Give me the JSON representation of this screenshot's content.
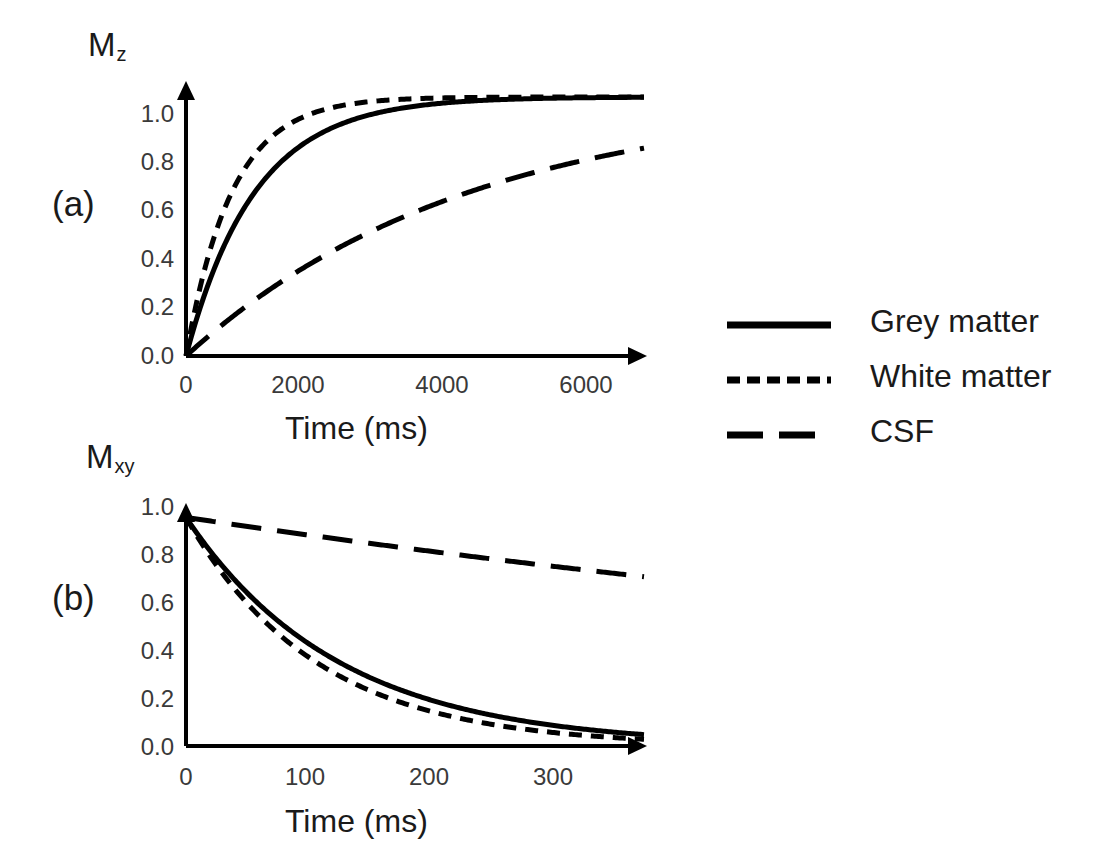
{
  "figure": {
    "background": "#ffffff",
    "ink": "#000000"
  },
  "panels": [
    {
      "label": "(a)",
      "y_axis_name": "M",
      "y_axis_sub": "z",
      "x_title": "Time (ms)",
      "y_ticks": [
        "1.0",
        "0.8",
        "0.6",
        "0.4",
        "0.2",
        "0.0"
      ],
      "x_ticks": [
        "0",
        "2000",
        "4000",
        "6000"
      ]
    },
    {
      "label": "(b)",
      "y_axis_name": "M",
      "y_axis_sub": "xy",
      "x_title": "Time (ms)",
      "y_ticks": [
        "1.0",
        "0.8",
        "0.6",
        "0.4",
        "0.2",
        "0.0"
      ],
      "x_ticks": [
        "0",
        "100",
        "200",
        "300"
      ]
    }
  ],
  "legend": {
    "position": "right-middle",
    "items": [
      {
        "label": "Grey matter",
        "style": "solid",
        "color": "#000000",
        "icon": "solid-line-icon"
      },
      {
        "label": "White matter",
        "style": "dotted",
        "color": "#000000",
        "icon": "short-dashed-line-icon"
      },
      {
        "label": "CSF",
        "style": "long-dash",
        "color": "#000000",
        "icon": "long-dashed-line-icon"
      }
    ]
  },
  "chart_data": [
    {
      "type": "line",
      "panel": "(a)",
      "title": "",
      "xlabel": "Time (ms)",
      "ylabel": "Mz",
      "xlim": [
        0,
        6000
      ],
      "ylim": [
        0.0,
        1.05
      ],
      "xticks": [
        0,
        2000,
        4000,
        6000
      ],
      "yticks": [
        0.0,
        0.2,
        0.4,
        0.6,
        0.8,
        1.0
      ],
      "grid": false,
      "legend_position": "right-middle",
      "model": "Mz = 1 - exp(-t/T1)",
      "x": [
        0,
        250,
        500,
        750,
        1000,
        1500,
        2000,
        2500,
        3000,
        3500,
        4000,
        4500,
        5000,
        5500,
        6000
      ],
      "series": [
        {
          "name": "Grey matter",
          "style": "solid",
          "T1": 900,
          "values": [
            0.0,
            0.24,
            0.43,
            0.57,
            0.67,
            0.81,
            0.89,
            0.94,
            0.96,
            0.98,
            0.99,
            0.99,
            1.0,
            1.0,
            1.0
          ]
        },
        {
          "name": "White matter",
          "style": "dotted",
          "T1": 600,
          "values": [
            0.0,
            0.34,
            0.57,
            0.71,
            0.81,
            0.92,
            0.96,
            0.98,
            0.99,
            1.0,
            1.0,
            1.0,
            1.0,
            1.0,
            1.0
          ]
        },
        {
          "name": "CSF",
          "style": "long-dash",
          "T1": 3700,
          "values": [
            0.0,
            0.065,
            0.13,
            0.18,
            0.24,
            0.33,
            0.42,
            0.49,
            0.56,
            0.61,
            0.66,
            0.7,
            0.74,
            0.77,
            0.8
          ]
        }
      ]
    },
    {
      "type": "line",
      "panel": "(b)",
      "title": "",
      "xlabel": "Time (ms)",
      "ylabel": "Mxy",
      "xlim": [
        0,
        300
      ],
      "ylim": [
        0.0,
        1.05
      ],
      "xticks": [
        0,
        100,
        200,
        300
      ],
      "yticks": [
        0.0,
        0.2,
        0.4,
        0.6,
        0.8,
        1.0
      ],
      "grid": false,
      "legend_position": "right-middle",
      "model": "Mxy = exp(-t/T2)",
      "x": [
        0,
        25,
        50,
        75,
        100,
        125,
        150,
        175,
        200,
        225,
        250,
        275,
        300
      ],
      "series": [
        {
          "name": "Grey matter",
          "style": "solid",
          "T2": 100,
          "values": [
            1.0,
            0.78,
            0.61,
            0.47,
            0.37,
            0.29,
            0.22,
            0.17,
            0.14,
            0.105,
            0.082,
            0.064,
            0.05
          ]
        },
        {
          "name": "White matter",
          "style": "dotted",
          "T2": 85,
          "values": [
            1.0,
            0.745,
            0.555,
            0.41,
            0.31,
            0.23,
            0.17,
            0.13,
            0.095,
            0.07,
            0.052,
            0.039,
            0.029
          ]
        },
        {
          "name": "CSF",
          "style": "long-dash",
          "T2": 1000,
          "values": [
            1.0,
            0.975,
            0.951,
            0.928,
            0.905,
            0.882,
            0.861,
            0.84,
            0.819,
            0.798,
            0.779,
            0.76,
            0.741
          ]
        }
      ]
    }
  ]
}
